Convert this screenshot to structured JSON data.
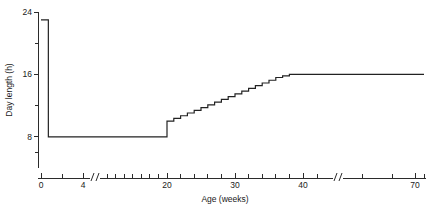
{
  "chart_data": {
    "type": "line",
    "title": "",
    "xlabel": "Age (weeks)",
    "ylabel": "Day length (h)",
    "xlim": [
      0,
      78
    ],
    "ylim": [
      4,
      24
    ],
    "grid": false,
    "legend": "none",
    "step_style": "post",
    "x_tick_labels": [
      "0",
      "4",
      "20",
      "30",
      "40",
      "70"
    ],
    "x_tick_values": [
      0,
      4,
      20,
      30,
      40,
      70
    ],
    "x_minor_ticks": [
      2,
      6,
      8,
      10,
      12,
      14,
      16,
      18,
      22,
      24,
      26,
      28,
      32,
      34,
      36,
      38,
      42,
      50,
      60,
      78
    ],
    "x_axis_breaks": [
      5.2,
      44
    ],
    "y_tick_labels": [
      "24",
      "16",
      "8"
    ],
    "y_tick_values": [
      24,
      16,
      8
    ],
    "y_minor_ticks": [
      20,
      12,
      6
    ],
    "series": [
      {
        "name": "Day length program",
        "x": [
          0,
          0.7,
          0.7,
          20,
          20,
          21,
          21,
          22,
          22,
          23,
          23,
          24,
          24,
          25,
          25,
          26,
          26,
          27,
          27,
          28,
          28,
          29,
          29,
          30,
          30,
          31,
          31,
          32,
          32,
          33,
          33,
          34,
          34,
          35,
          35,
          36,
          36,
          37,
          37,
          38,
          38,
          78
        ],
        "y": [
          23,
          23,
          8,
          8,
          10,
          10,
          10.35,
          10.35,
          10.7,
          10.7,
          11.05,
          11.05,
          11.4,
          11.4,
          11.75,
          11.75,
          12.1,
          12.1,
          12.45,
          12.45,
          12.8,
          12.8,
          13.15,
          13.15,
          13.5,
          13.5,
          13.85,
          13.85,
          14.2,
          14.2,
          14.55,
          14.55,
          14.9,
          14.9,
          15.25,
          15.25,
          15.6,
          15.6,
          15.8,
          15.8,
          16,
          16
        ]
      }
    ],
    "annotations": [
      {
        "label": "initial day length",
        "x": 0,
        "y": 23
      },
      {
        "label": "short-day plateau",
        "x": 10,
        "y": 8
      },
      {
        "label": "step-up onset",
        "x": 20,
        "y": 10
      },
      {
        "label": "final plateau",
        "x": 38,
        "y": 16
      }
    ],
    "colors": {
      "line": "#222222",
      "axis": "#2b2b2b",
      "background": "#ffffff"
    }
  }
}
